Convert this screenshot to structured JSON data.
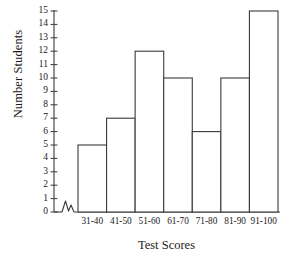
{
  "chart_data": {
    "type": "bar",
    "title": "",
    "xlabel": "Test Scores",
    "ylabel": "Number Students",
    "categories": [
      "31-40",
      "41-50",
      "51-60",
      "61-70",
      "71-80",
      "81-90",
      "91-100"
    ],
    "values": [
      5,
      7,
      12,
      10,
      6,
      10,
      15
    ],
    "ylim": [
      0,
      15
    ],
    "yticks": [
      0,
      1,
      2,
      3,
      4,
      5,
      6,
      7,
      8,
      9,
      10,
      11,
      12,
      13,
      14,
      15
    ],
    "ytick_labels": [
      "0",
      "1",
      "2",
      "3",
      "4",
      "5",
      "6",
      "7",
      "8",
      "9",
      "10",
      "11",
      "12",
      "13",
      "14",
      "15"
    ],
    "grid": false,
    "legend": null,
    "axis_break": true,
    "bar_fill": "#ffffff",
    "bar_edge": "#3a3a3a",
    "axis_color": "#3a3a3a",
    "background": "#ffffff"
  }
}
